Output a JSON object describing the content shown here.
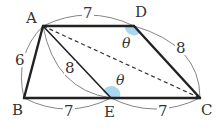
{
  "figure": {
    "type": "geometry",
    "vertices": [
      {
        "id": "A",
        "label": "A",
        "x": 43,
        "y": 26,
        "lx": 24,
        "ly": 22
      },
      {
        "id": "D",
        "label": "D",
        "x": 134,
        "y": 26,
        "lx": 136,
        "ly": 16
      },
      {
        "id": "B",
        "label": "B",
        "x": 24,
        "y": 98,
        "lx": 13,
        "ly": 114
      },
      {
        "id": "E",
        "label": "E",
        "x": 111,
        "y": 98,
        "lx": 105,
        "ly": 116
      },
      {
        "id": "C",
        "label": "C",
        "x": 200,
        "y": 98,
        "lx": 201,
        "ly": 114
      }
    ],
    "edges": [
      {
        "from": "A",
        "to": "D",
        "style": "thick"
      },
      {
        "from": "D",
        "to": "C",
        "style": "thick"
      },
      {
        "from": "A",
        "to": "B",
        "style": "thick"
      },
      {
        "from": "B",
        "to": "C",
        "style": "thick"
      },
      {
        "from": "A",
        "to": "E",
        "style": "solid"
      },
      {
        "from": "A",
        "to": "C",
        "style": "dashed"
      }
    ],
    "lengths": [
      {
        "segment": "AD",
        "value": "7"
      },
      {
        "segment": "DC",
        "value": "8"
      },
      {
        "segment": "AB",
        "value": "6"
      },
      {
        "segment": "AE",
        "value": "8"
      },
      {
        "segment": "BE",
        "value": "7"
      },
      {
        "segment": "EC",
        "value": "7"
      }
    ],
    "angles": [
      {
        "vertex": "D",
        "label": "θ",
        "color": "#a9d7f0"
      },
      {
        "vertex": "E",
        "label": "θ",
        "color": "#a9d7f0"
      }
    ]
  },
  "labels": {
    "A": "A",
    "B": "B",
    "C": "C",
    "D": "D",
    "E": "E",
    "AD": "7",
    "DC": "8",
    "AB": "6",
    "AE": "8",
    "BE": "7",
    "EC": "7",
    "theta_D": "θ",
    "theta_E": "θ"
  },
  "colors": {
    "line": "#222222",
    "angle_fill": "#a9d7f0",
    "dimension_arc": "#777777"
  }
}
